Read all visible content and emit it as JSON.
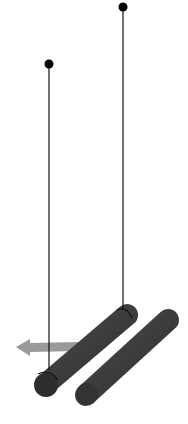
{
  "diagram": {
    "colors": {
      "background": "#ffffff",
      "rod": "#3a3a3a",
      "rod_end": "#2e2e2e",
      "thread": "#111111",
      "pivot": "#000000",
      "arrow": "#9a9a9a"
    },
    "pivots": [
      {
        "id": "left",
        "x": 49,
        "y": 64
      },
      {
        "id": "right",
        "x": 123,
        "y": 7
      }
    ],
    "threads": [
      {
        "from": "left",
        "x": 49,
        "y1": 64,
        "y2": 366
      },
      {
        "from": "right",
        "x": 123,
        "y1": 7,
        "y2": 312
      }
    ],
    "rods": [
      {
        "id": "suspended-rod",
        "x1": 46,
        "y1": 384,
        "x2": 127,
        "y2": 315,
        "thickness": 22
      },
      {
        "id": "fixed-rod",
        "x1": 86,
        "y1": 395,
        "x2": 168,
        "y2": 320,
        "thickness": 22
      }
    ],
    "arrow": {
      "direction": "left",
      "x_tail": 78,
      "x_head": 16,
      "y": 347
    }
  }
}
